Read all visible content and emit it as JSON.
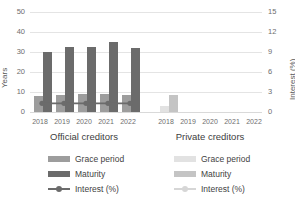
{
  "chart_data": {
    "type": "bar",
    "title": "",
    "xlabel": "",
    "ylabel": "Years",
    "y2label": "Interest (%)",
    "ylim": [
      0,
      50
    ],
    "y2lim": [
      0,
      15
    ],
    "yticks": [
      "0",
      "10",
      "20",
      "30",
      "40",
      "50"
    ],
    "y2ticks": [
      "0",
      "3",
      "6",
      "9",
      "12",
      "15"
    ],
    "grid": true,
    "legend_position": "bottom",
    "categories": [
      "2018",
      "2019",
      "2020",
      "2021",
      "2022"
    ],
    "groups": [
      {
        "name": "Official creditors",
        "series": [
          {
            "name": "Grace period",
            "unit": "Years",
            "axis": "left",
            "color": "#9d9d9d",
            "values": [
              8.2,
              8.3,
              9.0,
              9.2,
              8.7
            ]
          },
          {
            "name": "Maturity",
            "unit": "Years",
            "axis": "left",
            "color": "#6b6b6b",
            "values": [
              30.0,
              32.6,
              32.3,
              35.0,
              32.2
            ]
          },
          {
            "name": "Interest (%)",
            "unit": "%",
            "axis": "right",
            "color": "#6b6b6b",
            "values": [
              1.3,
              1.3,
              1.3,
              1.3,
              1.3
            ]
          }
        ]
      },
      {
        "name": "Private creditors",
        "series": [
          {
            "name": "Grace period",
            "unit": "Years",
            "axis": "left",
            "color": "#e2e2e2",
            "values": [
              3.0,
              0,
              0,
              0,
              0
            ]
          },
          {
            "name": "Maturity",
            "unit": "Years",
            "axis": "left",
            "color": "#c4c4c4",
            "values": [
              8.5,
              0,
              0,
              0,
              0
            ]
          },
          {
            "name": "Interest (%)",
            "unit": "%",
            "axis": "right",
            "color": "#d6d6d6",
            "values": [
              0,
              0,
              0,
              0,
              0
            ]
          }
        ]
      }
    ]
  },
  "axes": {
    "left_title": "Years",
    "right_title": "Interest (%)",
    "left_ticks": [
      "50",
      "40",
      "30",
      "20",
      "10",
      "0"
    ],
    "right_ticks": [
      "15",
      "12",
      "9",
      "6",
      "3",
      "0"
    ]
  },
  "groups": {
    "official": {
      "title": "Official creditors",
      "years": [
        "2018",
        "2019",
        "2020",
        "2021",
        "2022"
      ]
    },
    "private": {
      "title": "Private creditors",
      "years": [
        "2018",
        "2019",
        "2020",
        "2021",
        "2022"
      ]
    }
  },
  "legend": {
    "official": {
      "grace": "Grace period",
      "maturity": "Maturity",
      "interest": "Interest (%)"
    },
    "private": {
      "grace": "Grace period",
      "maturity": "Maturity",
      "interest": "Interest (%)"
    }
  },
  "colors": {
    "grace_official": "#9d9d9d",
    "maturity_official": "#6b6b6b",
    "interest_official": "#6b6b6b",
    "grace_private": "#e2e2e2",
    "maturity_private": "#c4c4c4",
    "interest_private": "#d6d6d6",
    "grid": "#e4e4e4"
  }
}
